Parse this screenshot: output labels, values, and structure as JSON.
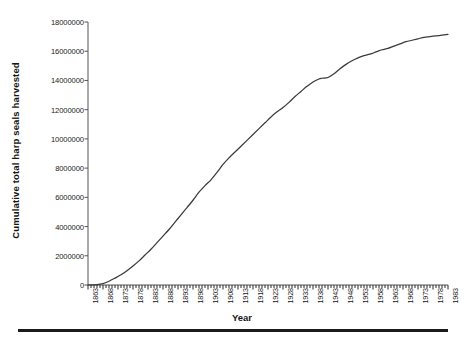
{
  "axes": {
    "y_title": "Cumulative total harp seals harvested",
    "x_title": "Year",
    "y_ticks": [
      "0",
      "2000000",
      "4000000",
      "6000000",
      "8000000",
      "10000000",
      "12000000",
      "14000000",
      "16000000",
      "18000000"
    ],
    "x_ticks": [
      "1863",
      "1868",
      "1873",
      "1878",
      "1883",
      "1888",
      "1893",
      "1898",
      "1903",
      "1908",
      "1913",
      "1918",
      "1923",
      "1928",
      "1933",
      "1938",
      "1943",
      "1948",
      "1953",
      "1958",
      "1963",
      "1968",
      "1973",
      "1978",
      "1983"
    ]
  },
  "style": {
    "line_color": "#3a3a3a",
    "axis_color": "#555555",
    "text_color": "#1a1a1a",
    "rule_color": "#1b1b1b",
    "background": "#ffffff"
  },
  "chart_data": {
    "type": "line",
    "title": "",
    "subtitle": "",
    "xlabel": "Year",
    "ylabel": "Cumulative total harp seals harvested",
    "xlim": [
      1863,
      1983
    ],
    "ylim": [
      0,
      18000000
    ],
    "grid": false,
    "legend": "none",
    "y_tick_interval": 2000000,
    "x_tick_interval": 1,
    "x_label_interval": 5,
    "series": [
      {
        "name": "Cumulative total harp seals harvested",
        "x": [
          1863,
          1866,
          1868,
          1870,
          1872,
          1874,
          1876,
          1878,
          1880,
          1882,
          1884,
          1886,
          1888,
          1890,
          1892,
          1894,
          1896,
          1898,
          1900,
          1902,
          1904,
          1906,
          1908,
          1910,
          1912,
          1914,
          1916,
          1918,
          1920,
          1922,
          1924,
          1926,
          1928,
          1930,
          1932,
          1934,
          1936,
          1938,
          1940,
          1941,
          1943,
          1945,
          1947,
          1949,
          1951,
          1953,
          1955,
          1957,
          1959,
          1961,
          1963,
          1965,
          1967,
          1969,
          1971,
          1973,
          1975,
          1977,
          1979,
          1981,
          1983
        ],
        "values": [
          0,
          30000,
          100000,
          260000,
          470000,
          700000,
          980000,
          1300000,
          1650000,
          2050000,
          2450000,
          2900000,
          3350000,
          3800000,
          4300000,
          4800000,
          5300000,
          5800000,
          6350000,
          6800000,
          7200000,
          7700000,
          8250000,
          8700000,
          9100000,
          9500000,
          9900000,
          10300000,
          10700000,
          11100000,
          11500000,
          11850000,
          12150000,
          12500000,
          12900000,
          13250000,
          13600000,
          13900000,
          14100000,
          14150000,
          14200000,
          14450000,
          14800000,
          15100000,
          15350000,
          15550000,
          15700000,
          15800000,
          15950000,
          16100000,
          16200000,
          16350000,
          16500000,
          16650000,
          16750000,
          16850000,
          16950000,
          17000000,
          17050000,
          17100000,
          17150000
        ]
      }
    ]
  }
}
